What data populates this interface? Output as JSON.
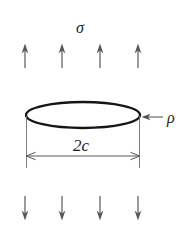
{
  "figure": {
    "background_color": "#ffffff",
    "width": 185,
    "height": 230
  },
  "labels": {
    "remote_stress": "σ",
    "crack_tip_radius": "ρ",
    "crack_diameter": "2c"
  },
  "colors": {
    "crack_outline": "#151515",
    "load_arrow": "#59595b",
    "dimension_line": "#57575a",
    "extension_line": "#6d6d6f",
    "rho_arrow": "#4f4f52",
    "text": "#1b1b1b"
  },
  "geometry": {
    "ellipse": {
      "cx": 83,
      "cy": 115,
      "rx": 57,
      "ry": 13
    },
    "top_arrows_x": [
      25,
      62,
      100,
      138
    ],
    "top_arrow_y_top": 44,
    "top_arrow_y_bottom": 68,
    "bottom_arrows_x": [
      25,
      62,
      100,
      138
    ],
    "bottom_arrow_y_top": 196,
    "bottom_arrow_y_bottom": 220,
    "dimension_y": 156,
    "dimension_x_left": 26,
    "dimension_x_right": 140,
    "extension_top_y": 120,
    "extension_bottom_y": 168,
    "rho_arrow_tail_x": 163,
    "rho_arrow_tip_x": 143,
    "rho_arrow_y": 117
  },
  "text_positions": {
    "sigma": {
      "x": 80,
      "y": 33
    },
    "rho": {
      "x": 167,
      "y": 123
    },
    "two_c": {
      "x": 81,
      "y": 151
    }
  },
  "arrow_counts": {
    "top": 4,
    "bottom": 4
  }
}
